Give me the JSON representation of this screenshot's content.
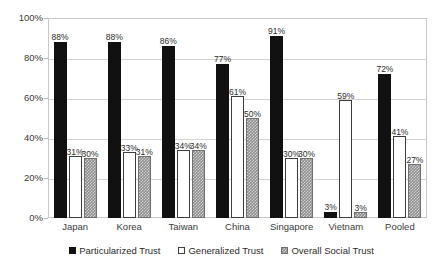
{
  "chart_data": {
    "type": "bar",
    "title": "",
    "subtitle": "",
    "xlabel": "",
    "ylabel": "",
    "ylim": [
      0,
      100
    ],
    "ytick_labels": [
      "0%",
      "20%",
      "40%",
      "60%",
      "80%",
      "100%"
    ],
    "ytick_values": [
      0,
      20,
      40,
      60,
      80,
      100
    ],
    "grid": "horizontal",
    "legend_position": "bottom",
    "value_suffix": "%",
    "categories": [
      "Japan",
      "Korea",
      "Taiwan",
      "China",
      "Singapore",
      "Vietnam",
      "Pooled"
    ],
    "series": [
      {
        "name": "Particularized Trust",
        "color": "#111111",
        "values": [
          88,
          88,
          86,
          77,
          91,
          3,
          72
        ],
        "labels": [
          "88%",
          "88%",
          "86%",
          "77%",
          "91%",
          "3%",
          "72%"
        ]
      },
      {
        "name": "Generalized Trust",
        "color": "#ffffff",
        "values": [
          31,
          33,
          34,
          61,
          30,
          59,
          41
        ],
        "labels": [
          "31%",
          "33%",
          "34%",
          "61%",
          "30%",
          "59%",
          "41%"
        ]
      },
      {
        "name": "Overall Social Trust",
        "color": "#8e8e8e",
        "values": [
          30,
          31,
          34,
          50,
          30,
          3,
          27
        ],
        "labels": [
          "30%",
          "31%",
          "34%",
          "50%",
          "30%",
          "3%",
          "27%"
        ]
      }
    ]
  }
}
